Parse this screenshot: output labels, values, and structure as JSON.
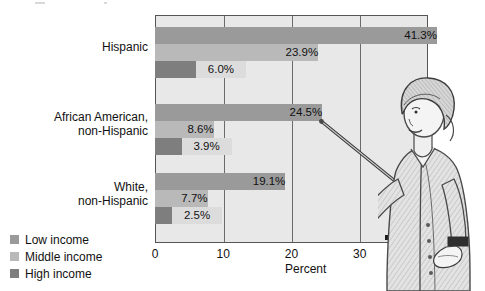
{
  "chart_data": {
    "type": "bar",
    "orientation": "horizontal",
    "title": "",
    "xlabel": "Percent",
    "ylabel": "",
    "xlim": [
      0,
      40
    ],
    "xticks": [
      "0",
      "10",
      "20",
      "30",
      "40"
    ],
    "grid": true,
    "legend_position": "bottom-left",
    "categories": [
      "Hispanic",
      "African American, non-Hispanic",
      "White, non-Hispanic"
    ],
    "series": [
      {
        "name": "Low income",
        "values": [
          41.3,
          24.5,
          19.1
        ],
        "color": "#9a9a9a"
      },
      {
        "name": "Middle income",
        "values": [
          23.9,
          8.6,
          7.7
        ],
        "color": "#b9b9b9"
      },
      {
        "name": "High income",
        "values": [
          6.0,
          3.9,
          2.5
        ],
        "color": "#7e7e7e"
      }
    ],
    "data_labels": [
      [
        "41.3%",
        "23.9%",
        "6.0%"
      ],
      [
        "24.5%",
        "8.6%",
        "3.9%"
      ],
      [
        "19.1%",
        "7.7%",
        "2.5%"
      ]
    ]
  },
  "axis": {
    "x_title": "Percent",
    "ticks": [
      {
        "label": "0",
        "value": 0
      },
      {
        "label": "10",
        "value": 10
      },
      {
        "label": "20",
        "value": 20
      },
      {
        "label": "30",
        "value": 30
      },
      {
        "label": "40",
        "value": 40
      }
    ]
  },
  "categories": [
    {
      "line1": "Hispanic",
      "line2": ""
    },
    {
      "line1": "African American,",
      "line2": "non-Hispanic"
    },
    {
      "line1": "White,",
      "line2": "non-Hispanic"
    }
  ],
  "legend": {
    "items": [
      {
        "label": "Low income",
        "color": "#9a9a9a"
      },
      {
        "label": "Middle income",
        "color": "#b9b9b9"
      },
      {
        "label": "High income",
        "color": "#7e7e7e"
      }
    ]
  },
  "illustration": {
    "name": "woman-with-pointer",
    "description": "Line drawing of a woman holding a pointer at a chart"
  }
}
